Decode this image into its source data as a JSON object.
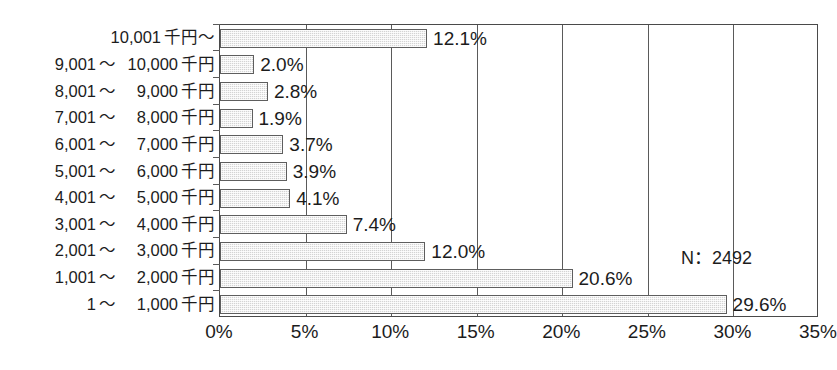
{
  "chart_data": {
    "type": "bar",
    "orientation": "horizontal",
    "title": "",
    "subtitle": "",
    "xlabel": "",
    "ylabel": "",
    "categories": [
      "10,001 千円～",
      "9,001 ～ 10,000 千円",
      "8,001 ～ 9,000 千円",
      "7,001 ～ 8,000 千円",
      "6,001 ～ 7,000 千円",
      "5,001 ～ 6,000 千円",
      "4,001 ～ 5,000 千円",
      "3,001 ～ 4,000 千円",
      "2,001 ～ 3,000 千円",
      "1,001 ～ 2,000 千円",
      "1 ～ 1,000 千円"
    ],
    "values": [
      12.1,
      2.0,
      2.8,
      1.9,
      3.7,
      3.9,
      4.1,
      7.4,
      12.0,
      20.6,
      29.6
    ],
    "value_labels": [
      "12.1%",
      "2.0%",
      "2.8%",
      "1.9%",
      "3.7%",
      "3.9%",
      "4.1%",
      "7.4%",
      "12.0%",
      "20.6%",
      "29.6%"
    ],
    "xlim": [
      0,
      35
    ],
    "xticks": [
      0,
      5,
      10,
      15,
      20,
      25,
      30,
      35
    ],
    "xtick_labels": [
      "0%",
      "5%",
      "10%",
      "15%",
      "20%",
      "25%",
      "30%",
      "35%"
    ],
    "grid": true,
    "legend": null,
    "annotations": [
      {
        "text": "N：2492",
        "x": 26.5,
        "y_index": 9
      }
    ]
  },
  "categories_parts": [
    {
      "lo": "10,001",
      "tilde": "",
      "hi": "",
      "unit": "千円～",
      "single": true
    },
    {
      "lo": "9,001",
      "tilde": "～",
      "hi": "10,000",
      "unit": "千円",
      "single": false
    },
    {
      "lo": "8,001",
      "tilde": "～",
      "hi": "9,000",
      "unit": "千円",
      "single": false
    },
    {
      "lo": "7,001",
      "tilde": "～",
      "hi": "8,000",
      "unit": "千円",
      "single": false
    },
    {
      "lo": "6,001",
      "tilde": "～",
      "hi": "7,000",
      "unit": "千円",
      "single": false
    },
    {
      "lo": "5,001",
      "tilde": "～",
      "hi": "6,000",
      "unit": "千円",
      "single": false
    },
    {
      "lo": "4,001",
      "tilde": "～",
      "hi": "5,000",
      "unit": "千円",
      "single": false
    },
    {
      "lo": "3,001",
      "tilde": "～",
      "hi": "4,000",
      "unit": "千円",
      "single": false
    },
    {
      "lo": "2,001",
      "tilde": "～",
      "hi": "3,000",
      "unit": "千円",
      "single": false
    },
    {
      "lo": "1,001",
      "tilde": "～",
      "hi": "2,000",
      "unit": "千円",
      "single": false
    },
    {
      "lo": "1",
      "tilde": "～",
      "hi": "1,000",
      "unit": "千円",
      "single": false
    }
  ],
  "annotation": {
    "n_label": "N：2492"
  },
  "colors": {
    "bar_fill": "#d4d4d4",
    "bar_border": "#5e5e5e",
    "axis": "#4a4a4a",
    "grid": "#5a5a5a",
    "text": "#1c1c1c",
    "background": "#ffffff"
  }
}
